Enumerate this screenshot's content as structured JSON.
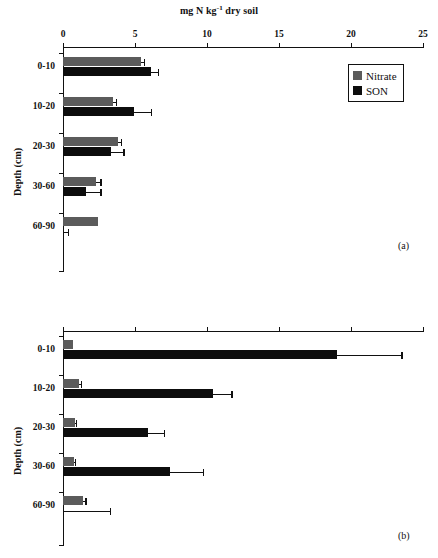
{
  "figure": {
    "axis_title_x": "mg N kg",
    "axis_title_x_sup": "-1",
    "axis_title_x_tail": " dry soil",
    "axis_title_y": "Depth (cm)"
  },
  "legend": {
    "position": "top-right-panel-a",
    "items": [
      {
        "label": "Nitrate",
        "color": "#5b5b5b"
      },
      {
        "label": "SON",
        "color": "#0d0d0d"
      }
    ]
  },
  "panels": [
    {
      "tag": "(a)"
    },
    {
      "tag": "(b)"
    }
  ],
  "xticks": [
    "0",
    "5",
    "10",
    "15",
    "20",
    "25"
  ],
  "categories": [
    "0-10",
    "10-20",
    "20-30",
    "30-60",
    "60-90"
  ],
  "chart_data": [
    {
      "type": "bar",
      "orientation": "horizontal",
      "panel": "(a)",
      "title": "mg N kg-1 dry soil",
      "xlabel": "mg N kg-1 dry soil",
      "ylabel": "Depth (cm)",
      "xlim": [
        0,
        25
      ],
      "xticks": [
        0,
        5,
        10,
        15,
        20,
        25
      ],
      "categories": [
        "0-10",
        "10-20",
        "20-30",
        "30-60",
        "60-90"
      ],
      "grid": false,
      "legend": [
        "Nitrate",
        "SON"
      ],
      "series": [
        {
          "name": "Nitrate",
          "color": "#5b5b5b",
          "values": [
            5.4,
            3.5,
            3.8,
            2.3,
            2.4
          ],
          "errors": [
            0.2,
            0.15,
            0.2,
            0.3,
            0.0
          ]
        },
        {
          "name": "SON",
          "color": "#0d0d0d",
          "values": [
            6.1,
            4.9,
            3.3,
            1.6,
            0.0
          ],
          "errors": [
            0.5,
            1.2,
            0.9,
            1.0,
            0.35
          ]
        }
      ]
    },
    {
      "type": "bar",
      "orientation": "horizontal",
      "panel": "(b)",
      "title": "",
      "xlabel": "mg N kg-1 dry soil",
      "ylabel": "Depth (cm)",
      "xlim": [
        0,
        25
      ],
      "xticks": [
        0,
        5,
        10,
        15,
        20,
        25
      ],
      "categories": [
        "0-10",
        "10-20",
        "20-30",
        "30-60",
        "60-90"
      ],
      "grid": false,
      "legend": [
        "Nitrate",
        "SON"
      ],
      "series": [
        {
          "name": "Nitrate",
          "color": "#5b5b5b",
          "values": [
            0.7,
            1.1,
            0.8,
            0.75,
            1.4
          ],
          "errors": [
            0.0,
            0.15,
            0.1,
            0.1,
            0.15
          ]
        },
        {
          "name": "SON",
          "color": "#0d0d0d",
          "values": [
            19.0,
            10.4,
            5.9,
            7.4,
            0.05
          ],
          "errors": [
            4.5,
            1.3,
            1.1,
            2.3,
            3.2
          ]
        }
      ]
    }
  ]
}
